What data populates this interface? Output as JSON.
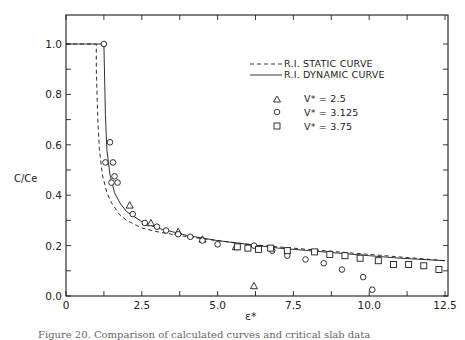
{
  "chart_data": {
    "type": "scatter",
    "title": "",
    "xlabel": "ε*",
    "ylabel": "C/Ce",
    "xlim": [
      0,
      12.5
    ],
    "ylim": [
      0.0,
      1.1
    ],
    "grid": false,
    "legend_position": "upper right",
    "x_ticks": [
      0,
      2.5,
      5.0,
      7.5,
      10.0,
      12.5
    ],
    "x_tick_labels": [
      "0",
      "2.5",
      "5.0",
      "7.5",
      "10.0",
      "12.5"
    ],
    "y_ticks": [
      0.0,
      0.2,
      0.4,
      0.6,
      0.8,
      1.0
    ],
    "y_tick_labels": [
      "0.0",
      "0.2",
      "0.4",
      "0.6",
      "0.8",
      "1.0"
    ],
    "series": [
      {
        "name": "R.I. STATIC CURVE",
        "kind": "line",
        "style": "dashed",
        "x": [
          0,
          1.0,
          1.0,
          1.05,
          1.1,
          1.2,
          1.35,
          1.5,
          1.75,
          2.0,
          2.5,
          3.0,
          3.5,
          4.0,
          5.0,
          6.0,
          7.0,
          8.0,
          9.0,
          10.0,
          11.0,
          12.5
        ],
        "y": [
          1.0,
          1.0,
          0.9,
          0.7,
          0.58,
          0.48,
          0.41,
          0.37,
          0.325,
          0.3,
          0.27,
          0.255,
          0.245,
          0.235,
          0.22,
          0.205,
          0.195,
          0.185,
          0.175,
          0.165,
          0.155,
          0.14
        ]
      },
      {
        "name": "R.I. DYNAMIC CURVE",
        "kind": "line",
        "style": "solid",
        "x": [
          0,
          1.25,
          1.3,
          1.35,
          1.45,
          1.6,
          1.8,
          2.0,
          2.5,
          3.0,
          3.5,
          4.0,
          5.0,
          6.0,
          7.0,
          8.0,
          9.0,
          10.0,
          11.0,
          12.5
        ],
        "y": [
          1.0,
          1.0,
          0.72,
          0.58,
          0.48,
          0.41,
          0.365,
          0.335,
          0.295,
          0.27,
          0.255,
          0.24,
          0.22,
          0.205,
          0.19,
          0.18,
          0.17,
          0.16,
          0.15,
          0.14
        ]
      },
      {
        "name": "V* = 2.5",
        "kind": "scatter",
        "marker": "triangle",
        "x": [
          2.1,
          2.8,
          3.7,
          4.5,
          5.6,
          6.2
        ],
        "y": [
          0.36,
          0.29,
          0.255,
          0.225,
          0.195,
          0.04
        ]
      },
      {
        "name": "V* = 3.125",
        "kind": "scatter",
        "marker": "circle",
        "x": [
          1.25,
          1.45,
          1.55,
          1.6,
          1.7,
          2.2,
          2.6,
          3.0,
          3.3,
          3.7,
          4.1,
          4.5,
          5.0,
          6.2,
          6.8,
          7.3,
          7.9,
          8.5,
          9.1,
          9.8,
          10.1,
          1.3,
          1.5
        ],
        "y": [
          1.0,
          0.61,
          0.53,
          0.475,
          0.45,
          0.325,
          0.29,
          0.275,
          0.26,
          0.245,
          0.235,
          0.22,
          0.205,
          0.2,
          0.18,
          0.16,
          0.145,
          0.13,
          0.105,
          0.075,
          0.025,
          0.53,
          0.45
        ]
      },
      {
        "name": "V* = 3.75",
        "kind": "scatter",
        "marker": "square",
        "x": [
          5.65,
          6.0,
          6.35,
          6.75,
          7.3,
          8.2,
          8.7,
          9.2,
          9.7,
          10.3,
          10.8,
          11.3,
          11.8,
          12.3
        ],
        "y": [
          0.195,
          0.19,
          0.185,
          0.19,
          0.18,
          0.175,
          0.165,
          0.16,
          0.15,
          0.14,
          0.125,
          0.125,
          0.12,
          0.105
        ]
      }
    ]
  },
  "legend": {
    "static_label": "R.I. STATIC CURVE",
    "dynamic_label": "R.I. DYNAMIC CURVE",
    "v1_label": "V* = 2.5",
    "v2_label": "V* = 3.125",
    "v3_label": "V* = 3.75"
  },
  "axes": {
    "ylabel": "C/Ce",
    "xlabel": "ε*"
  },
  "caption": "Figure 20.  Comparison of calculated curves and critical slab data"
}
